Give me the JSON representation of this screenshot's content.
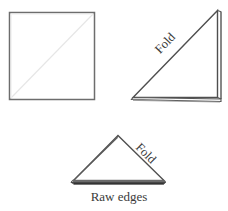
{
  "figure": {
    "background_color": "#ffffff",
    "ink_color": "#4a4a4a",
    "fold_crease_color": "#e8e8e8",
    "label_color": "#3a3a3a",
    "width": 228,
    "height": 211
  },
  "steps": [
    {
      "id": "step-1-square",
      "name": "square",
      "shape": "square",
      "description": "Open square of fabric with faint diagonal crease",
      "corners": [
        [
          9,
          12
        ],
        [
          95,
          12
        ],
        [
          95,
          100
        ],
        [
          9,
          100
        ]
      ],
      "crease": [
        [
          9,
          100
        ],
        [
          95,
          12
        ]
      ],
      "labels": []
    },
    {
      "id": "step-2-right-triangle",
      "name": "first-fold-triangle",
      "shape": "right-triangle",
      "description": "Square folded once on the diagonal into a right triangle",
      "corners": [
        [
          132,
          99
        ],
        [
          218,
          10
        ],
        [
          218,
          99
        ]
      ],
      "crease": [
        [
          132,
          99
        ],
        [
          218,
          10
        ]
      ],
      "labels": [
        {
          "id": "fold-label-top",
          "text": "Fold",
          "x": 168,
          "y": 46,
          "rotation": -46
        }
      ]
    },
    {
      "id": "step-3-small-triangle",
      "name": "second-fold-triangle",
      "shape": "isosceles-triangle",
      "description": "Triangle folded again, raw edges along the bottom",
      "corners": [
        [
          118,
          135
        ],
        [
          165,
          182
        ],
        [
          72,
          182
        ]
      ],
      "labels": [
        {
          "id": "fold-label-bottom",
          "text": "Fold",
          "x": 143,
          "y": 157,
          "rotation": 45
        },
        {
          "id": "raw-edges-label",
          "text": "Raw edges",
          "x": 119,
          "y": 199,
          "rotation": 0
        }
      ]
    }
  ],
  "text": {
    "fold_top": "Fold",
    "fold_bottom": "Fold",
    "raw_edges": "Raw edges"
  }
}
